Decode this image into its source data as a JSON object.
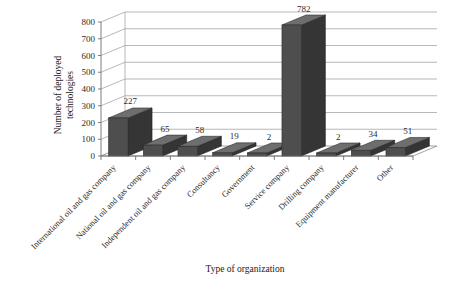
{
  "chart_data": {
    "type": "bar",
    "title": "",
    "subtitle": "",
    "xlabel": "Type of organization",
    "ylabel": "Number of deployed technologies",
    "ylabel_line1": "Number of deployed",
    "ylabel_line2": "technologies",
    "ylim": [
      0,
      800
    ],
    "ytick_step": 100,
    "yticks": [
      "0",
      "100",
      "200",
      "300",
      "400",
      "500",
      "600",
      "700",
      "800"
    ],
    "ytick_values": [
      0,
      100,
      200,
      300,
      400,
      500,
      600,
      700,
      800
    ],
    "grid": true,
    "grid_axis": "y",
    "legend": "none",
    "three_d": true,
    "categories": [
      "International oil and gas company",
      "National oil and gas company",
      "Independent oil and gas company",
      "Consultancy",
      "Government",
      "Service company",
      "Drilling company",
      "Equipment manufacturer",
      "Other"
    ],
    "values": [
      227,
      65,
      58,
      19,
      2,
      782,
      2,
      34,
      51
    ],
    "value_labels": [
      "227",
      "65",
      "58",
      "19",
      "2",
      "782",
      "2",
      "34",
      "51"
    ],
    "series": [
      {
        "name": "Number of deployed technologies",
        "values": [
          227,
          65,
          58,
          19,
          2,
          782,
          2,
          34,
          51
        ],
        "color": "#4e4e4e"
      }
    ],
    "colors": {
      "bar_front": "#4e4e4e",
      "bar_top": "#6e6e6e",
      "bar_side": "#353535",
      "grid": "#9a9a9a",
      "axis": "#6f6f6f",
      "text": "#2b2b2b",
      "background": "#ffffff"
    }
  }
}
